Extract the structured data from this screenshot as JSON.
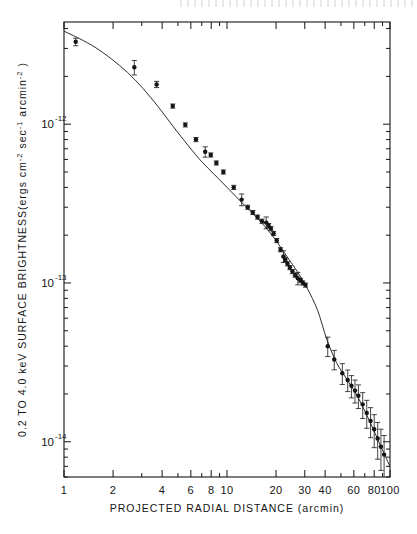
{
  "figure": {
    "background_color": "#ffffff",
    "ink_color": "#151515",
    "frame": {
      "left": 64,
      "top": 22,
      "right": 390,
      "bottom": 477
    }
  },
  "chart_data": {
    "type": "scatter",
    "title": "",
    "subtitle": "",
    "xlabel": "PROJECTED RADIAL DISTANCE (arcmin)",
    "ylabel": "0.2 TO 4.0 keV SURFACE BRIGHTNESS(ergs cm⁻² sec⁻¹ arcmin⁻²)",
    "ylabel_parts": {
      "lead": "0.2 TO 4.0 keV  SURFACE  BRIGHTNESS(ergs cm",
      "sup1": "-2",
      "mid": " sec",
      "sup2": "-1",
      "tail": " arcmin",
      "sup3": "-2",
      "close": " )"
    },
    "xscale": "log",
    "yscale": "log",
    "xlim": [
      1,
      100
    ],
    "ylim": [
      6e-15,
      4.4e-12
    ],
    "grid": false,
    "legend": null,
    "x_tick_labels": [
      "1",
      "2",
      "4",
      "6",
      "8",
      "10",
      "20",
      "30",
      "40",
      "60",
      "80",
      "100"
    ],
    "x_tick_values": [
      1,
      2,
      4,
      6,
      8,
      10,
      20,
      30,
      40,
      60,
      80,
      100
    ],
    "x_minor_ticks": [
      3,
      5,
      7,
      9,
      50,
      70,
      90
    ],
    "y_tick_labels": [
      "10⁻¹²",
      "10⁻¹³",
      "10⁻¹⁴"
    ],
    "y_tick_values": [
      1e-12,
      1e-13,
      1e-14
    ],
    "y_tick_exponents": [
      "-12",
      "-13",
      "-14"
    ],
    "series": [
      {
        "name": "surface brightness data",
        "marker": "filled-circle",
        "marker_size": 3.0,
        "x": [
          1.18,
          2.7,
          3.7,
          4.65,
          5.55,
          6.45,
          7.35,
          7.95,
          8.6,
          9.5,
          11.0,
          12.3,
          13.4,
          14.4,
          15.4,
          16.4,
          17.4,
          18.0,
          18.6,
          19.3,
          20.2,
          21.3,
          22.2,
          22.8,
          23.5,
          24.3,
          25.2,
          26.2,
          27.2,
          28.2,
          29.2,
          30.3,
          41.5,
          45.5,
          51.0,
          55.0,
          58.0,
          61.0,
          64.0,
          68.0,
          72.0,
          76.0,
          80.0,
          84.0,
          88.0,
          92.0
        ],
        "y": [
          3.3e-12,
          2.28e-12,
          1.78e-12,
          1.3e-12,
          9.9e-13,
          8e-13,
          6.7e-13,
          6.4e-13,
          5.7e-13,
          5e-13,
          4e-13,
          3.35e-13,
          3e-13,
          2.78e-13,
          2.6e-13,
          2.45e-13,
          2.4e-13,
          2.3e-13,
          2.2e-13,
          2.05e-13,
          1.85e-13,
          1.62e-13,
          1.47e-13,
          1.4e-13,
          1.32e-13,
          1.25e-13,
          1.18e-13,
          1.12e-13,
          1.07e-13,
          1.04e-13,
          1e-13,
          9.7e-14,
          4e-14,
          3.3e-14,
          2.7e-14,
          2.45e-14,
          2.25e-14,
          2.1e-14,
          1.95e-14,
          1.72e-14,
          1.52e-14,
          1.35e-14,
          1.2e-14,
          1.05e-14,
          9.3e-15,
          8.3e-15
        ],
        "yerr_rel": [
          0.055,
          0.105,
          0.045,
          0.03,
          0.03,
          0.03,
          0.075,
          0.03,
          0.03,
          0.03,
          0.03,
          0.085,
          0.03,
          0.03,
          0.03,
          0.03,
          0.085,
          0.03,
          0.03,
          0.03,
          0.03,
          0.03,
          0.085,
          0.03,
          0.03,
          0.03,
          0.03,
          0.03,
          0.09,
          0.03,
          0.03,
          0.03,
          0.14,
          0.14,
          0.15,
          0.155,
          0.16,
          0.165,
          0.17,
          0.185,
          0.2,
          0.215,
          0.235,
          0.26,
          0.29,
          0.32
        ]
      }
    ],
    "fit_curve": {
      "name": "model fit",
      "style": "solid",
      "x": [
        1.0,
        1.25,
        1.55,
        1.95,
        2.45,
        3.05,
        3.8,
        4.7,
        5.8,
        7.0,
        8.4,
        10.0,
        12.0,
        14.5,
        17.0,
        20.0,
        23.5,
        27.0,
        31.0,
        36.0,
        41.0,
        47.0,
        54.0,
        62.0,
        71.0,
        81.0,
        92.0,
        100.0
      ],
      "y": [
        3.85e-12,
        3.45e-12,
        3.05e-12,
        2.58e-12,
        2.12e-12,
        1.68e-12,
        1.28e-12,
        9.6e-13,
        7.3e-13,
        5.8e-13,
        4.8e-13,
        4e-13,
        3.3e-13,
        2.72e-13,
        2.28e-13,
        1.85e-13,
        1.45e-13,
        1.18e-13,
        9.3e-14,
        6.7e-14,
        4.4e-14,
        3.15e-14,
        2.5e-14,
        2e-14,
        1.52e-14,
        1.13e-14,
        8.4e-15,
        7e-15
      ]
    }
  }
}
